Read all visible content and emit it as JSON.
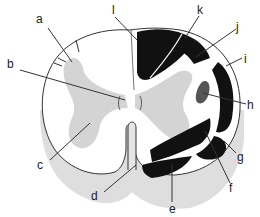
{
  "diagram": {
    "type": "spinal-cord-cross-section",
    "colors": {
      "white_matter": "#ffffff",
      "gray_matter": "#d4d4d4",
      "shadow": "#dedede",
      "tract": "#111111",
      "nucleus": "#555555",
      "outline": "#333333",
      "leader": "#333333"
    },
    "labels": [
      {
        "id": "a",
        "text": "a",
        "x": 36,
        "y": 13
      },
      {
        "id": "b",
        "text": "b",
        "x": 7,
        "y": 58
      },
      {
        "id": "c",
        "text": "c",
        "x": 37,
        "y": 159
      },
      {
        "id": "d",
        "text": "d",
        "x": 91,
        "y": 190
      },
      {
        "id": "e",
        "text": "e",
        "x": 171,
        "y": 203
      },
      {
        "id": "f",
        "text": "f",
        "x": 229,
        "y": 179
      },
      {
        "id": "g",
        "text": "g",
        "x": 237,
        "y": 149
      },
      {
        "id": "h",
        "text": "h",
        "x": 247,
        "y": 99
      },
      {
        "id": "i",
        "text": "i",
        "x": 244,
        "y": 53
      },
      {
        "id": "j",
        "text": "j",
        "x": 236,
        "y": 23
      },
      {
        "id": "k",
        "text": "k",
        "x": 197,
        "y": 4
      },
      {
        "id": "l",
        "text": "l",
        "x": 111,
        "y": 4
      }
    ]
  }
}
